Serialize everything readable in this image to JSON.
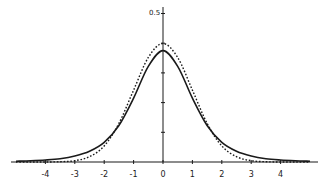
{
  "chart_data": {
    "type": "line",
    "title": "",
    "xlabel": "",
    "ylabel": "",
    "xlim": [
      -5.2,
      5.3
    ],
    "ylim": [
      0,
      0.5
    ],
    "grid": false,
    "legend": null,
    "x_ticks": [
      -4,
      -3,
      -2,
      -1,
      0,
      1,
      2,
      3,
      4
    ],
    "x_tick_labels": [
      "-4",
      "-3",
      "-2",
      "-1",
      "0",
      "1",
      "2",
      "3",
      "4"
    ],
    "y_ticks": [
      0.1,
      0.2,
      0.3,
      0.4,
      0.5
    ],
    "y_tick_labels_visible": [
      "0.5"
    ],
    "x": [
      -5,
      -4.5,
      -4,
      -3.5,
      -3,
      -2.5,
      -2,
      -1.5,
      -1,
      -0.5,
      0,
      0.5,
      1,
      1.5,
      2,
      2.5,
      3,
      3.5,
      4,
      4.5,
      5
    ],
    "series": [
      {
        "name": "solid curve (heavy-tailed)",
        "style": "solid",
        "values": [
          0.0027,
          0.0042,
          0.0067,
          0.011,
          0.02,
          0.036,
          0.066,
          0.123,
          0.215,
          0.322,
          0.375,
          0.322,
          0.215,
          0.123,
          0.066,
          0.036,
          0.02,
          0.011,
          0.0067,
          0.0042,
          0.0027
        ]
      },
      {
        "name": "dashed curve (normal)",
        "style": "dashed",
        "values": [
          0.0,
          0.0,
          0.0001,
          0.0009,
          0.0044,
          0.018,
          0.054,
          0.13,
          0.242,
          0.352,
          0.399,
          0.352,
          0.242,
          0.13,
          0.054,
          0.018,
          0.0044,
          0.0009,
          0.0001,
          0.0,
          0.0
        ]
      }
    ],
    "annotations": []
  },
  "colors": {
    "ink": "#1a1a1a",
    "background": "#ffffff"
  }
}
